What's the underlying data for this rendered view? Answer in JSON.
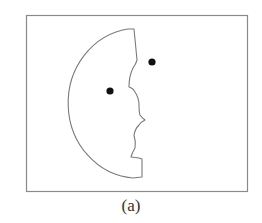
{
  "figure": {
    "caption": "(a)",
    "frame": {
      "x": 26,
      "y": 15,
      "width": 221,
      "height": 176,
      "stroke": "#8a8a8a"
    },
    "shape": {
      "name": "half-face-silhouette",
      "stroke": "#7a7a7a",
      "fill": "#ffffff"
    },
    "dots": [
      {
        "name": "dot-upper-right",
        "cx": 152,
        "cy": 62,
        "r": 3.6,
        "color": "#111111"
      },
      {
        "name": "dot-left",
        "cx": 110,
        "cy": 91,
        "r": 3.6,
        "color": "#111111"
      }
    ]
  }
}
